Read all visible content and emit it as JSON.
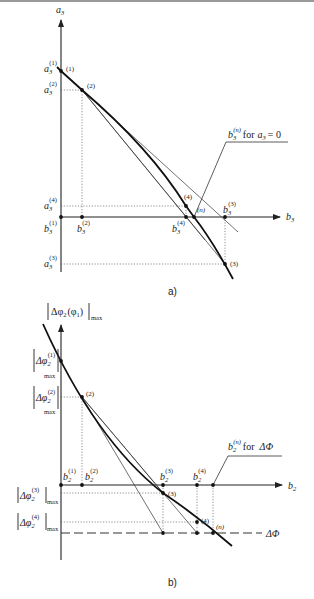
{
  "figure_a": {
    "caption": "a)",
    "y_axis": {
      "symbol": "a",
      "sub": "3"
    },
    "x_axis": {
      "symbol": "b",
      "sub": "3"
    },
    "y_ticks": [
      {
        "symbol": "a",
        "sub": "3",
        "sup": "(1)"
      },
      {
        "symbol": "a",
        "sub": "3",
        "sup": "(2)"
      },
      {
        "symbol": "a",
        "sub": "3",
        "sup": "(4)"
      },
      {
        "symbol": "a",
        "sub": "3",
        "sup": "(3)"
      }
    ],
    "x_ticks": [
      {
        "symbol": "b",
        "sub": "3",
        "sup": "(1)"
      },
      {
        "symbol": "b",
        "sub": "3",
        "sup": "(2)"
      },
      {
        "symbol": "b",
        "sub": "3",
        "sup": "(4)"
      },
      {
        "symbol": "b",
        "sub": "3",
        "sup": "(3)"
      }
    ],
    "points": [
      "(1)",
      "(2)",
      "(3)",
      "(4)",
      "(n)"
    ],
    "annotation": {
      "symbol": "b",
      "sub": "3",
      "sup": "(n)",
      "text": "for",
      "condition_symbol": "a",
      "condition_sub": "3",
      "condition_rest": "= 0"
    }
  },
  "figure_b": {
    "caption": "b)",
    "y_axis": {
      "prefix": "Δφ",
      "sub": "2",
      "arg": "(φ",
      "arg_sub": "1",
      "arg_close": ")",
      "suffix": "max"
    },
    "x_axis": {
      "symbol": "b",
      "sub": "2"
    },
    "y_ticks": [
      {
        "symbol": "Δφ",
        "sub": "2",
        "sup": "(1)",
        "suffix": "max"
      },
      {
        "symbol": "Δφ",
        "sub": "2",
        "sup": "(2)",
        "suffix": "max"
      },
      {
        "symbol": "Δφ",
        "sub": "2",
        "sup": "(3)",
        "suffix": "max"
      },
      {
        "symbol": "Δφ",
        "sub": "2",
        "sup": "(4)",
        "suffix": "max"
      }
    ],
    "x_ticks": [
      {
        "symbol": "b",
        "sub": "2",
        "sup": "(1)"
      },
      {
        "symbol": "b",
        "sub": "2",
        "sup": "(2)"
      },
      {
        "symbol": "b",
        "sub": "2",
        "sup": "(3)"
      },
      {
        "symbol": "b",
        "sub": "2",
        "sup": "(4)"
      }
    ],
    "points": [
      "(2)",
      "(3)",
      "(4)",
      "(n)"
    ],
    "threshold_label": "ΔΦ",
    "annotation": {
      "symbol": "b",
      "sub": "2",
      "sup": "(n)",
      "text": "for",
      "condition": "ΔΦ"
    }
  }
}
